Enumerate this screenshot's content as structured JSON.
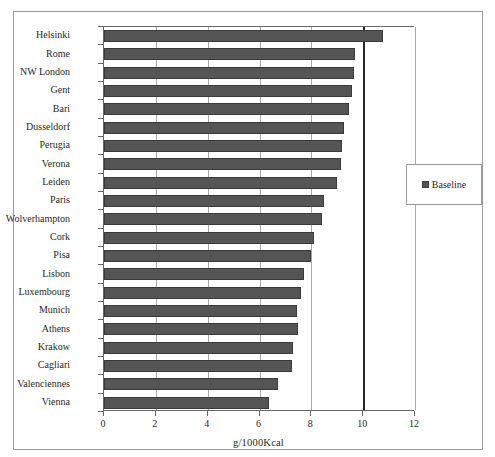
{
  "chart_data": {
    "type": "bar",
    "orientation": "horizontal",
    "title": "",
    "xlabel": "g/1000Kcal",
    "ylabel": "",
    "xlim": [
      0,
      12
    ],
    "xticks": [
      0,
      2,
      4,
      6,
      8,
      10,
      12
    ],
    "grid": true,
    "grid_axis": "x",
    "emphasis_gridline": 10,
    "legend": {
      "position": "right",
      "entries": [
        {
          "name": "Baseline",
          "color": "#555555"
        }
      ]
    },
    "categories": [
      "Helsinki",
      "Rome",
      "NW London",
      "Gent",
      "Bari",
      "Dusseldorf",
      "Perugia",
      "Verona",
      "Leiden",
      "Paris",
      "Wolverhampton",
      "Cork",
      "Pisa",
      "Lisbon",
      "Luxembourg",
      "Munich",
      "Athens",
      "Krakow",
      "Cagliari",
      "Valenciennes",
      "Vienna"
    ],
    "series": [
      {
        "name": "Baseline",
        "color": "#555555",
        "values": [
          10.75,
          9.7,
          9.65,
          9.55,
          9.45,
          9.25,
          9.2,
          9.15,
          9.0,
          8.5,
          8.4,
          8.1,
          8.0,
          7.7,
          7.6,
          7.45,
          7.5,
          7.3,
          7.25,
          6.7,
          6.35
        ]
      }
    ]
  }
}
